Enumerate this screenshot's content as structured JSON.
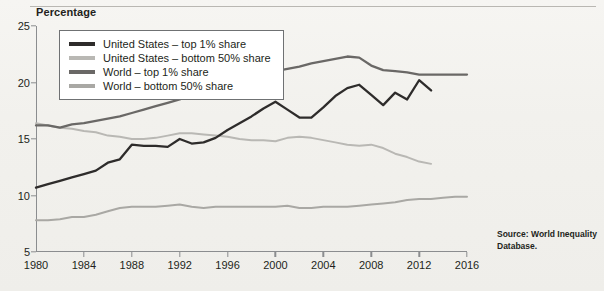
{
  "figure": {
    "y_axis_title": "Percentage",
    "source_note": "Source: World Inequality Database."
  },
  "colors": {
    "us_top1": "#2e2c2b",
    "us_bottom50": "#b9b8b4",
    "world_top1": "#6a6866",
    "world_bottom50": "#a9a8a4",
    "axis": "#8b8d8f",
    "background": "#f4f3f0",
    "legend_border": "#6f7173"
  },
  "legend": {
    "items": [
      {
        "label": "United States – top 1% share",
        "key": "us_top1",
        "swatch": "legend-swatch-us-top1"
      },
      {
        "label": "United States – bottom 50% share",
        "key": "us_bottom50",
        "swatch": "legend-swatch-us-bottom50"
      },
      {
        "label": "World – top 1% share",
        "key": "world_top1",
        "swatch": "legend-swatch-world-top1"
      },
      {
        "label": "World – bottom 50% share",
        "key": "world_bottom50",
        "swatch": "legend-swatch-world-bottom50"
      }
    ]
  },
  "chart_data": {
    "type": "line",
    "title": "",
    "subtitle": "",
    "xlabel": "",
    "ylabel": "Percentage",
    "xlim": [
      1980,
      2016
    ],
    "ylim": [
      5,
      25
    ],
    "yticks": [
      5,
      10,
      15,
      20,
      25
    ],
    "xticks": [
      1980,
      1984,
      1988,
      1992,
      1996,
      2000,
      2004,
      2008,
      2012,
      2016
    ],
    "grid": false,
    "legend_position": "top-left inside plot",
    "series": [
      {
        "name": "United States – top 1% share",
        "color": "#2e2c2b",
        "x": [
          1980,
          1981,
          1982,
          1983,
          1984,
          1985,
          1986,
          1987,
          1988,
          1989,
          1990,
          1991,
          1992,
          1993,
          1994,
          1995,
          1996,
          1997,
          1998,
          1999,
          2000,
          2001,
          2002,
          2003,
          2004,
          2005,
          2006,
          2007,
          2008,
          2009,
          2010,
          2011,
          2012,
          2013
        ],
        "values": [
          10.7,
          11.0,
          11.3,
          11.6,
          11.9,
          12.2,
          12.9,
          13.2,
          14.5,
          14.4,
          14.4,
          14.3,
          15.0,
          14.6,
          14.7,
          15.1,
          15.8,
          16.4,
          17.0,
          17.7,
          18.3,
          17.6,
          16.9,
          16.9,
          17.8,
          18.8,
          19.5,
          19.8,
          18.9,
          18.0,
          19.1,
          18.5,
          20.2,
          19.3
        ],
        "note": "ends 2013"
      },
      {
        "name": "United States – bottom 50% share",
        "color": "#b9b8b4",
        "x": [
          1980,
          1981,
          1982,
          1983,
          1984,
          1985,
          1986,
          1987,
          1988,
          1989,
          1990,
          1991,
          1992,
          1993,
          1994,
          1995,
          1996,
          1997,
          1998,
          1999,
          2000,
          2001,
          2002,
          2003,
          2004,
          2005,
          2006,
          2007,
          2008,
          2009,
          2010,
          2011,
          2012,
          2013
        ],
        "values": [
          16.4,
          16.2,
          16.0,
          15.9,
          15.7,
          15.6,
          15.3,
          15.2,
          15.0,
          15.0,
          15.1,
          15.3,
          15.5,
          15.5,
          15.4,
          15.3,
          15.2,
          15.0,
          14.9,
          14.9,
          14.8,
          15.1,
          15.2,
          15.1,
          14.9,
          14.7,
          14.5,
          14.4,
          14.5,
          14.2,
          13.7,
          13.4,
          13.0,
          12.8
        ],
        "note": "ends 2013"
      },
      {
        "name": "World – top 1% share",
        "color": "#6a6866",
        "x": [
          1980,
          1981,
          1982,
          1983,
          1984,
          1985,
          1986,
          1987,
          1988,
          1989,
          1990,
          1991,
          1992,
          1993,
          1994,
          1995,
          1996,
          1997,
          1998,
          1999,
          2000,
          2001,
          2002,
          2003,
          2004,
          2005,
          2006,
          2007,
          2008,
          2009,
          2010,
          2011,
          2012,
          2013,
          2014,
          2015,
          2016
        ],
        "values": [
          16.2,
          16.2,
          16.0,
          16.3,
          16.4,
          16.6,
          16.8,
          17.0,
          17.3,
          17.6,
          17.9,
          18.2,
          18.5,
          18.9,
          19.2,
          19.5,
          19.8,
          20.2,
          20.5,
          20.8,
          21.0,
          21.2,
          21.4,
          21.7,
          21.9,
          22.1,
          22.3,
          22.2,
          21.5,
          21.1,
          21.0,
          20.9,
          20.7,
          20.7,
          20.7,
          20.7,
          20.7
        ]
      },
      {
        "name": "World – bottom 50% share",
        "color": "#a9a8a4",
        "x": [
          1980,
          1981,
          1982,
          1983,
          1984,
          1985,
          1986,
          1987,
          1988,
          1989,
          1990,
          1991,
          1992,
          1993,
          1994,
          1995,
          1996,
          1997,
          1998,
          1999,
          2000,
          2001,
          2002,
          2003,
          2004,
          2005,
          2006,
          2007,
          2008,
          2009,
          2010,
          2011,
          2012,
          2013,
          2014,
          2015,
          2016
        ],
        "values": [
          7.8,
          7.8,
          7.9,
          8.1,
          8.1,
          8.3,
          8.6,
          8.9,
          9.0,
          9.0,
          9.0,
          9.1,
          9.2,
          9.0,
          8.9,
          9.0,
          9.0,
          9.0,
          9.0,
          9.0,
          9.0,
          9.1,
          8.9,
          8.9,
          9.0,
          9.0,
          9.0,
          9.1,
          9.2,
          9.3,
          9.4,
          9.6,
          9.7,
          9.7,
          9.8,
          9.9,
          9.9
        ]
      }
    ]
  }
}
